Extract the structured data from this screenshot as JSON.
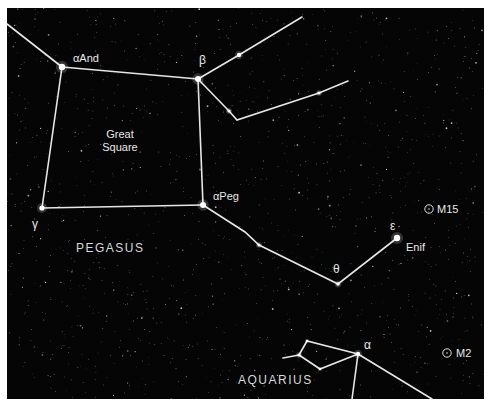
{
  "map": {
    "background": "#050505",
    "frame": {
      "x": 7,
      "y": 8,
      "width": 477,
      "height": 391
    },
    "line_color": "#e6e6e6",
    "constellations": [
      {
        "name": "PEGASUS",
        "label_x": 76,
        "label_y": 252
      },
      {
        "name": "AQUARIUS",
        "label_x": 238,
        "label_y": 384
      }
    ],
    "asterism": {
      "name_line1": "Great",
      "name_line2": "Square",
      "x": 120,
      "y1": 138,
      "y2": 151
    },
    "stars": [
      {
        "id": "alpha-and",
        "x": 62,
        "y": 67,
        "r": 3.2,
        "label": "αAnd",
        "lx": 73,
        "ly": 62
      },
      {
        "id": "beta-peg",
        "x": 198,
        "y": 79,
        "r": 3.0,
        "label": "β",
        "lx": 199,
        "ly": 64
      },
      {
        "id": "gamma-peg",
        "x": 42,
        "y": 208,
        "r": 2.6,
        "label": "γ",
        "lx": 32,
        "ly": 228
      },
      {
        "id": "alpha-peg",
        "x": 203,
        "y": 205,
        "r": 3.0,
        "label": "αPeg",
        "lx": 213,
        "ly": 200
      },
      {
        "id": "theta-peg",
        "x": 338,
        "y": 284,
        "r": 1.8,
        "label": "θ",
        "lx": 333,
        "ly": 273
      },
      {
        "id": "epsilon-peg",
        "x": 397,
        "y": 238,
        "r": 3.2,
        "label": "ε",
        "lx": 390,
        "ly": 230
      },
      {
        "id": "enif-name",
        "x": 397,
        "y": 238,
        "r": 0,
        "label": "Enif",
        "lx": 406,
        "ly": 251
      },
      {
        "id": "alpha-aqr",
        "x": 358,
        "y": 354,
        "r": 2.2,
        "label": "α",
        "lx": 364,
        "ly": 349
      },
      {
        "id": "star-b1",
        "x": 239,
        "y": 55,
        "r": 2.2,
        "label": "",
        "lx": 0,
        "ly": 0
      },
      {
        "id": "star-b2",
        "x": 229,
        "y": 111,
        "r": 1.6,
        "label": "",
        "lx": 0,
        "ly": 0
      },
      {
        "id": "star-b3",
        "x": 319,
        "y": 93,
        "r": 1.6,
        "label": "",
        "lx": 0,
        "ly": 0
      },
      {
        "id": "star-p1",
        "x": 259,
        "y": 245,
        "r": 1.6,
        "label": "",
        "lx": 0,
        "ly": 0
      },
      {
        "id": "star-a1",
        "x": 299,
        "y": 355,
        "r": 1.6,
        "label": "",
        "lx": 0,
        "ly": 0
      },
      {
        "id": "star-a2",
        "x": 320,
        "y": 369,
        "r": 1.2,
        "label": "",
        "lx": 0,
        "ly": 0
      },
      {
        "id": "star-a3",
        "x": 307,
        "y": 341,
        "r": 1.2,
        "label": "",
        "lx": 0,
        "ly": 0
      }
    ],
    "lines": [
      [
        [
          7,
          24
        ],
        [
          62,
          67
        ]
      ],
      [
        [
          62,
          67
        ],
        [
          198,
          79
        ]
      ],
      [
        [
          62,
          67
        ],
        [
          42,
          208
        ]
      ],
      [
        [
          42,
          208
        ],
        [
          203,
          205
        ]
      ],
      [
        [
          198,
          79
        ],
        [
          203,
          205
        ]
      ],
      [
        [
          198,
          79
        ],
        [
          239,
          55
        ],
        [
          302,
          17
        ]
      ],
      [
        [
          198,
          79
        ],
        [
          229,
          111
        ],
        [
          237,
          120
        ],
        [
          319,
          93
        ],
        [
          348,
          81
        ]
      ],
      [
        [
          203,
          205
        ],
        [
          245,
          232
        ],
        [
          259,
          245
        ],
        [
          338,
          284
        ],
        [
          397,
          238
        ]
      ],
      [
        [
          283,
          358
        ],
        [
          299,
          355
        ]
      ],
      [
        [
          299,
          355
        ],
        [
          307,
          341
        ],
        [
          358,
          354
        ]
      ],
      [
        [
          299,
          355
        ],
        [
          320,
          369
        ],
        [
          358,
          354
        ]
      ],
      [
        [
          358,
          354
        ],
        [
          352,
          399
        ]
      ],
      [
        [
          358,
          354
        ],
        [
          432,
          399
        ]
      ]
    ],
    "deep_sky_objects": [
      {
        "name": "M15",
        "x": 429,
        "y": 209,
        "lx": 437,
        "ly": 213
      },
      {
        "name": "M2",
        "x": 447,
        "y": 353,
        "lx": 456,
        "ly": 357
      }
    ]
  }
}
